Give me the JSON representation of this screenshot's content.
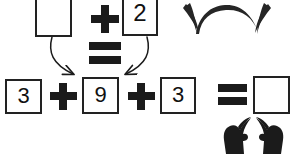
{
  "worksheet": {
    "title": "Addition equation worksheet with missing addends",
    "background_color": "#ffffff",
    "ink_color": "#1b1b1b",
    "box_border_color": "#222222",
    "canvas": {
      "width": 293,
      "height": 154
    }
  },
  "top_equation": {
    "description": "Partial sum shown above the main equation",
    "boxes": [
      {
        "name": "top-blank-box",
        "value": "",
        "is_blank": true
      },
      {
        "name": "top-two-box",
        "value": "2",
        "is_blank": false
      }
    ],
    "operators": [
      {
        "name": "top-plus",
        "symbol": "+"
      },
      {
        "name": "middle-equals",
        "symbol": "="
      }
    ]
  },
  "arrows": {
    "left_arrow": {
      "name": "arrow-left-to-nine",
      "label": "curved arrow from blank box down to 9 box"
    },
    "right_arrow": {
      "name": "arrow-right-to-nine",
      "label": "curved arrow from 2 box down to 9 box"
    }
  },
  "main_equation": {
    "terms": [
      {
        "name": "term-three-first",
        "value": "3",
        "is_blank": false
      },
      {
        "name": "term-nine",
        "value": "9",
        "is_blank": false
      },
      {
        "name": "term-three-second",
        "value": "3",
        "is_blank": false
      }
    ],
    "operators": [
      {
        "name": "main-plus-first",
        "symbol": "+"
      },
      {
        "name": "main-plus-second",
        "symbol": "+"
      },
      {
        "name": "main-equals",
        "symbol": "="
      }
    ],
    "answer": {
      "name": "answer-box",
      "value": "",
      "is_blank": true
    }
  },
  "decorations": {
    "top_right_arc": {
      "name": "decorative-arc-mark",
      "label": "hand-drawn arc flourish"
    },
    "bottom_right_hands": {
      "name": "decorative-hands-mark",
      "label": "pair of dark mitten-shaped hand silhouettes",
      "count": 2
    }
  }
}
